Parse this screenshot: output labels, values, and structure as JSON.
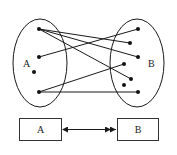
{
  "diagram": {
    "set_a": {
      "label": "A",
      "ellipse": {
        "cx": 40,
        "cy": 63,
        "rx": 27,
        "ry": 44
      },
      "label_pos": [
        23,
        67
      ],
      "points": [
        [
          39,
          29
        ],
        [
          39,
          57
        ],
        [
          34,
          72
        ],
        [
          39,
          92
        ]
      ]
    },
    "set_b": {
      "label": "B",
      "ellipse": {
        "cx": 137,
        "cy": 63,
        "rx": 27,
        "ry": 44
      },
      "label_pos": [
        148,
        67
      ],
      "points": [
        [
          138,
          29
        ],
        [
          130,
          43
        ],
        [
          138,
          57
        ],
        [
          124,
          64
        ],
        [
          131,
          79
        ],
        [
          124,
          85
        ],
        [
          138,
          92
        ]
      ]
    },
    "mappings": [
      {
        "from": [
          39,
          29
        ],
        "to": [
          130,
          43
        ]
      },
      {
        "from": [
          39,
          29
        ],
        "to": [
          138,
          57
        ]
      },
      {
        "from": [
          39,
          29
        ],
        "to": [
          131,
          79
        ]
      },
      {
        "from": [
          39,
          57
        ],
        "to": [
          138,
          29
        ]
      },
      {
        "from": [
          39,
          92
        ],
        "to": [
          124,
          64
        ]
      },
      {
        "from": [
          39,
          92
        ],
        "to": [
          138,
          92
        ]
      }
    ],
    "box_a": {
      "label": "A"
    },
    "box_b": {
      "label": "B"
    },
    "arrow": {
      "type": "bidirectional",
      "left_head": "single",
      "right_head": "double"
    },
    "stroke_color": "#1a1a1a"
  }
}
